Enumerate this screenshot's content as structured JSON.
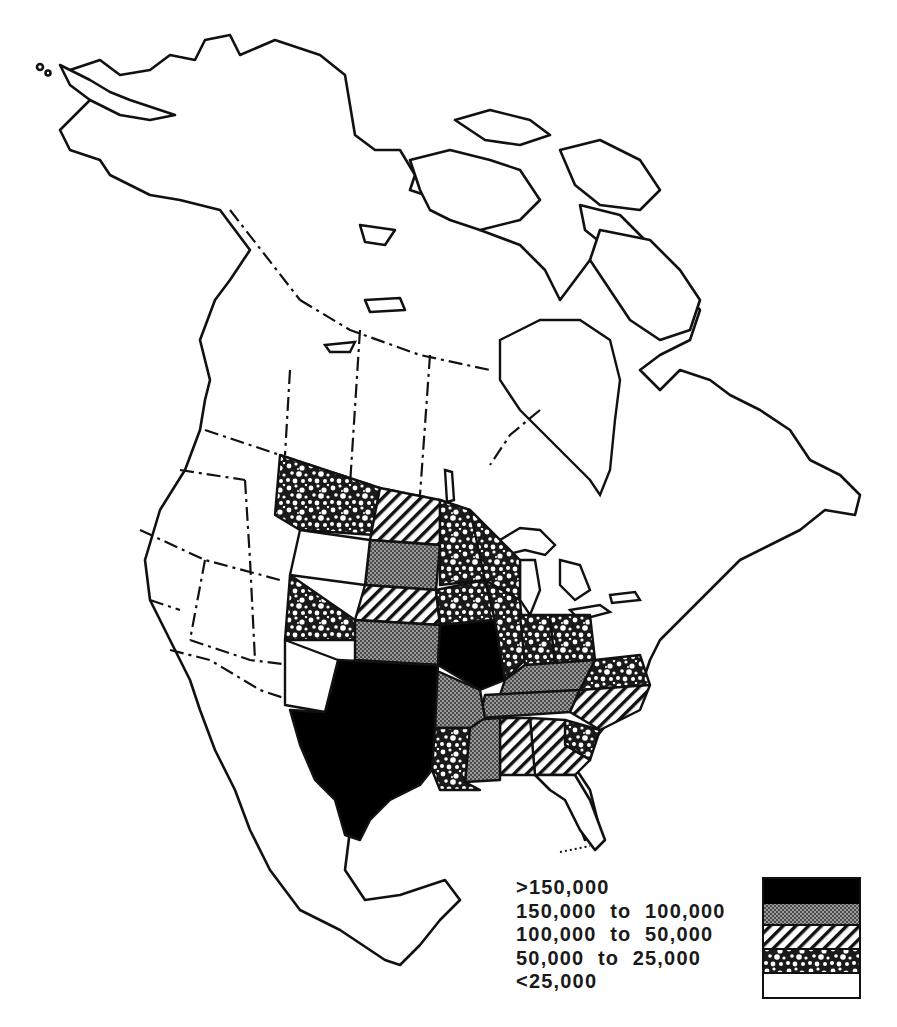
{
  "map": {
    "region": "North America",
    "unit_scope": "United States (by state)",
    "classes": [
      {
        "id": "c5",
        "label": ">150,000",
        "pattern": "solid-black",
        "color": "#000000"
      },
      {
        "id": "c4",
        "label": "150,000  to  100,000",
        "pattern": "fine-crosshatch-gray",
        "color": "#8a8a8a"
      },
      {
        "id": "c3",
        "label": "100,000  to  50,000",
        "pattern": "diagonal-hatch",
        "color": "#111111"
      },
      {
        "id": "c2",
        "label": "50,000  to  25,000",
        "pattern": "mottled-stipple",
        "color": "#444444"
      },
      {
        "id": "c1",
        "label": "<25,000",
        "pattern": "white",
        "color": "#ffffff"
      }
    ],
    "states": {
      ">150,000": [
        "Texas",
        "Oklahoma",
        "Missouri"
      ],
      "150,000 to 100,000": [
        "South Dakota",
        "Kansas",
        "Arkansas",
        "Mississippi",
        "Kentucky",
        "Tennessee"
      ],
      "100,000 to 50,000": [
        "North Dakota",
        "Nebraska",
        "Alabama",
        "Georgia",
        "North Carolina"
      ],
      "50,000 to 25,000": [
        "Montana",
        "Colorado",
        "Minnesota",
        "Iowa",
        "Illinois",
        "Indiana",
        "Ohio",
        "Louisiana",
        "South Carolina",
        "Virginia",
        "Wisconsin (south)"
      ],
      "<25,000": [
        "Washington",
        "Oregon",
        "California",
        "Idaho",
        "Nevada",
        "Utah",
        "Arizona",
        "New Mexico",
        "Wyoming",
        "Michigan",
        "Florida",
        "Pennsylvania",
        "New York",
        "New England",
        "West Virginia",
        "Alaska",
        "Canada",
        "Mexico"
      ]
    }
  },
  "legend": {
    "items": [
      {
        "label": ">150,000"
      },
      {
        "label": "150,000  to  100,000"
      },
      {
        "label": "100,000  to  50,000"
      },
      {
        "label": "50,000  to  25,000"
      },
      {
        "label": "<25,000"
      }
    ]
  }
}
